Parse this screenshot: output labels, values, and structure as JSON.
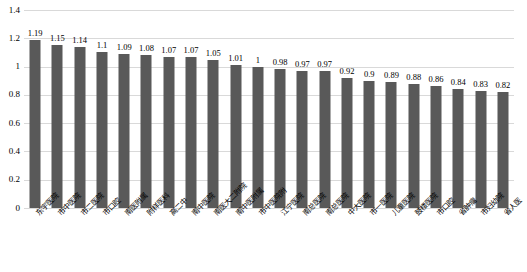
{
  "chart_data": {
    "type": "bar",
    "title": "",
    "subtitle": "",
    "xlabel": "",
    "ylabel": "",
    "ylim": [
      0,
      1.4
    ],
    "grid": true,
    "legend": false,
    "legend_position": "none",
    "bar_color": "#595959",
    "gridline_color": "#d9d9d9",
    "text_color": "#000000",
    "y_ticks": [
      "1.4",
      "1.2",
      "1",
      "0.8",
      "0.6",
      "0.4",
      "0.2",
      "0"
    ],
    "y_tick_values": [
      1.4,
      1.2,
      1.0,
      0.8,
      0.6,
      0.4,
      0.2,
      0
    ],
    "categories": [
      "东宇医院",
      "市中医院",
      "市二医院",
      "市口腔",
      "南医附属",
      "附样医科",
      "高二中",
      "南中医院",
      "南医大二附院",
      "南中医附属",
      "市中医院附",
      "江宁医院",
      "南总医院",
      "南总医院",
      "中大医院",
      "市一医院",
      "儿童医院",
      "鼓楼医院",
      "市口腔",
      "省肿瘤",
      "市妇幼院",
      "省人医"
    ],
    "values": [
      1.19,
      1.15,
      1.14,
      1.1,
      1.09,
      1.08,
      1.07,
      1.07,
      1.05,
      1.01,
      1,
      0.98,
      0.97,
      0.97,
      0.92,
      0.9,
      0.89,
      0.88,
      0.86,
      0.84,
      0.83,
      0.82
    ],
    "value_labels": [
      "1.19",
      "1.15",
      "1.14",
      "1.1",
      "1.09",
      "1.08",
      "1.07",
      "1.07",
      "1.05",
      "1.01",
      "1",
      "0.98",
      "0.97",
      "0.97",
      "0.92",
      "0.9",
      "0.89",
      "0.88",
      "0.86",
      "0.84",
      "0.83",
      "0.82"
    ]
  }
}
